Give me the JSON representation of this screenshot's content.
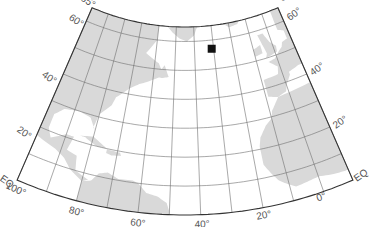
{
  "map": {
    "projection": "conic",
    "region": "North Atlantic",
    "colors": {
      "ocean": "#ffffff",
      "land": "#d9d9d9",
      "graticule": "#6e6e6e",
      "border": "#333333",
      "marker": "#111111",
      "label": "#555555"
    },
    "extent": {
      "lon_min": -100,
      "lon_max": 10,
      "lat_min": 0,
      "lat_max": 65
    },
    "graticule": {
      "meridians": [
        -100,
        -90,
        -80,
        -70,
        -60,
        -50,
        -40,
        -30,
        -20,
        -10,
        0,
        10
      ],
      "parallels": [
        10,
        20,
        30,
        40,
        50,
        60
      ]
    },
    "lat_labels_left": [
      {
        "text": "65°",
        "lat": 65,
        "dx": -12,
        "dy": -8
      },
      {
        "text": "60°",
        "lat": 60,
        "dx": -18,
        "dy": -2
      },
      {
        "text": "40°",
        "lat": 40,
        "dx": -22,
        "dy": 2
      },
      {
        "text": "20°",
        "lat": 20,
        "dx": -24,
        "dy": 4
      },
      {
        "text": "EQ",
        "lat": 0,
        "dx": -18,
        "dy": 0
      }
    ],
    "lat_labels_right": [
      {
        "text": "65°",
        "lat": 65,
        "dx": 4,
        "dy": -6
      },
      {
        "text": "60°",
        "lat": 60,
        "dx": 6,
        "dy": 0
      },
      {
        "text": "40°",
        "lat": 40,
        "dx": 6,
        "dy": 2
      },
      {
        "text": "20°",
        "lat": 20,
        "dx": 6,
        "dy": 2
      },
      {
        "text": "EQ",
        "lat": 0,
        "dx": 4,
        "dy": 2
      }
    ],
    "lon_labels": [
      {
        "text": "100°",
        "lon": -100,
        "dx": -12,
        "dy": 8
      },
      {
        "text": "80°",
        "lon": -80,
        "dx": -8,
        "dy": 12
      },
      {
        "text": "60°",
        "lon": -60,
        "dx": -8,
        "dy": 13
      },
      {
        "text": "40°",
        "lon": -40,
        "dx": -6,
        "dy": 13
      },
      {
        "text": "20°",
        "lon": -20,
        "dx": -6,
        "dy": 12
      },
      {
        "text": "0°",
        "lon": 0,
        "dx": -6,
        "dy": 10
      }
    ],
    "marker": {
      "lat": 57,
      "lon": -31,
      "size": 8,
      "label": ""
    },
    "land": [
      {
        "name": "north-america",
        "coords": [
          [
            -100,
            65
          ],
          [
            -60,
            65
          ],
          [
            -60,
            60
          ],
          [
            -65,
            55
          ],
          [
            -58,
            52
          ],
          [
            -55,
            48
          ],
          [
            -63,
            45
          ],
          [
            -66,
            44
          ],
          [
            -70,
            42
          ],
          [
            -75,
            38
          ],
          [
            -76,
            35
          ],
          [
            -80,
            31
          ],
          [
            -81,
            26
          ],
          [
            -80,
            25
          ],
          [
            -83,
            29
          ],
          [
            -88,
            30
          ],
          [
            -94,
            29
          ],
          [
            -97,
            26
          ],
          [
            -97,
            21
          ],
          [
            -95,
            18
          ],
          [
            -90,
            21
          ],
          [
            -87,
            21
          ],
          [
            -88,
            16
          ],
          [
            -84,
            15
          ],
          [
            -83,
            10
          ],
          [
            -78,
            8
          ],
          [
            -80,
            7
          ],
          [
            -85,
            10
          ],
          [
            -88,
            13
          ],
          [
            -92,
            15
          ],
          [
            -100,
            17
          ]
        ]
      },
      {
        "name": "greenland",
        "coords": [
          [
            -55,
            65
          ],
          [
            -38,
            65
          ],
          [
            -40,
            62
          ],
          [
            -44,
            60
          ],
          [
            -48,
            61
          ],
          [
            -52,
            63
          ]
        ]
      },
      {
        "name": "iceland",
        "coords": [
          [
            -23,
            65
          ],
          [
            -14,
            65
          ],
          [
            -15,
            64
          ],
          [
            -20,
            63.5
          ]
        ]
      },
      {
        "name": "british-isles",
        "coords": [
          [
            -6,
            58.5
          ],
          [
            -3,
            58.5
          ],
          [
            -1,
            55
          ],
          [
            1.5,
            53
          ],
          [
            1,
            51
          ],
          [
            -5,
            50
          ],
          [
            -4,
            51.5
          ],
          [
            -4.5,
            53.5
          ],
          [
            -5,
            55
          ]
        ]
      },
      {
        "name": "ireland",
        "coords": [
          [
            -10,
            54
          ],
          [
            -6,
            55
          ],
          [
            -6,
            52
          ],
          [
            -10,
            51.5
          ]
        ]
      },
      {
        "name": "europe",
        "coords": [
          [
            5,
            65
          ],
          [
            10,
            65
          ],
          [
            10,
            44
          ],
          [
            8,
            44
          ],
          [
            3,
            43
          ],
          [
            3,
            42
          ],
          [
            0,
            39
          ],
          [
            -1,
            37
          ],
          [
            -5,
            36
          ],
          [
            -9,
            37
          ],
          [
            -9,
            39
          ],
          [
            -9,
            43
          ],
          [
            -2,
            43.5
          ],
          [
            -1,
            46
          ],
          [
            -3,
            47.5
          ],
          [
            -4.5,
            48.5
          ],
          [
            -1,
            49
          ],
          [
            2,
            51
          ],
          [
            4,
            52
          ],
          [
            5,
            53.5
          ],
          [
            8,
            54
          ],
          [
            8,
            57
          ],
          [
            5,
            58
          ],
          [
            5,
            62
          ]
        ]
      },
      {
        "name": "africa",
        "coords": [
          [
            -5,
            36
          ],
          [
            10,
            37
          ],
          [
            10,
            4
          ],
          [
            9,
            4
          ],
          [
            5,
            4.5
          ],
          [
            0,
            5.5
          ],
          [
            -4,
            5
          ],
          [
            -8,
            4.5
          ],
          [
            -11,
            6.5
          ],
          [
            -13,
            8
          ],
          [
            -15,
            11
          ],
          [
            -17,
            14.5
          ],
          [
            -17,
            21
          ],
          [
            -16,
            24
          ],
          [
            -13,
            27.5
          ],
          [
            -10,
            29.5
          ],
          [
            -9,
            32
          ],
          [
            -7,
            34
          ]
        ]
      },
      {
        "name": "south-america",
        "coords": [
          [
            -80,
            0
          ],
          [
            -80,
            7
          ],
          [
            -77,
            8
          ],
          [
            -75,
            11
          ],
          [
            -72,
            12
          ],
          [
            -68,
            10.5
          ],
          [
            -63,
            10.7
          ],
          [
            -61,
            10
          ],
          [
            -58,
            7
          ],
          [
            -54,
            6
          ],
          [
            -51,
            4
          ],
          [
            -50,
            1
          ],
          [
            -50,
            0
          ]
        ]
      },
      {
        "name": "cuba",
        "coords": [
          [
            -85,
            22
          ],
          [
            -80,
            23
          ],
          [
            -76,
            21
          ],
          [
            -74,
            20
          ],
          [
            -78,
            20
          ],
          [
            -83,
            22
          ]
        ]
      },
      {
        "name": "hispaniola",
        "coords": [
          [
            -74,
            19.8
          ],
          [
            -69,
            19.5
          ],
          [
            -68.5,
            18.5
          ],
          [
            -72,
            18
          ],
          [
            -74,
            18.5
          ]
        ]
      },
      {
        "name": "newfoundland",
        "coords": [
          [
            -59,
            47.5
          ],
          [
            -55,
            51.5
          ],
          [
            -52.7,
            47.5
          ],
          [
            -56,
            47
          ]
        ]
      }
    ]
  }
}
